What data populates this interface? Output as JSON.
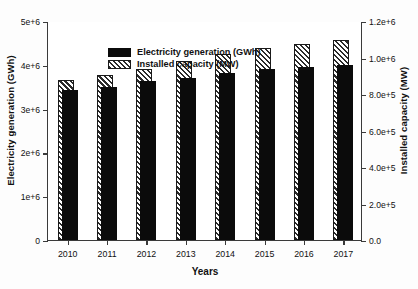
{
  "chart_data": {
    "type": "bar",
    "title": "",
    "xlabel": "Years",
    "ylabel": "Electricity generation (GWh)",
    "ylabel_right": "Installed capacity (MW)",
    "categories": [
      "2010",
      "2011",
      "2012",
      "2013",
      "2014",
      "2015",
      "2016",
      "2017"
    ],
    "ylim": [
      0,
      5000000
    ],
    "ylim_right": [
      0,
      1200000
    ],
    "grid": false,
    "legend_position": "top-left",
    "yticks": [
      0,
      1000000,
      2000000,
      3000000,
      4000000,
      5000000
    ],
    "ytick_labels": [
      "0",
      "1e+6",
      "2e+6",
      "3e+6",
      "4e+6",
      "5e+6"
    ],
    "yticks_right": [
      0,
      200000,
      400000,
      600000,
      800000,
      1000000,
      1200000
    ],
    "ytick_labels_right": [
      "0.0",
      "2.0e+5",
      "4.0e+5",
      "6.0e+5",
      "8.0e+5",
      "1.0e+6",
      "1.2e+6"
    ],
    "series": [
      {
        "name": "Electricity generation (GWh)",
        "axis": "left",
        "fill": "solid-black",
        "color": "#0b0b0b",
        "values": [
          3430000,
          3490000,
          3620000,
          3700000,
          3810000,
          3900000,
          3950000,
          4000000
        ]
      },
      {
        "name": "Installed capacity (MW)",
        "axis": "right",
        "fill": "diagonal-hatch",
        "color": "#2b2b2b",
        "values": [
          878000,
          905000,
          935000,
          980000,
          1020000,
          1050000,
          1075000,
          1095000
        ]
      }
    ]
  },
  "legend": {
    "items": [
      {
        "label": "Electricity generation (GWh)",
        "swatch": "solid-black"
      },
      {
        "label": "Installed capacity (MW)",
        "swatch": "diagonal-hatch"
      }
    ]
  }
}
